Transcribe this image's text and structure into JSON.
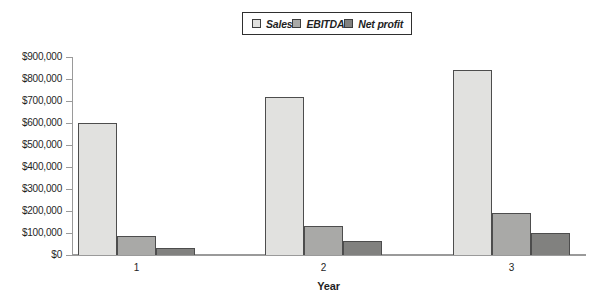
{
  "chart_data": {
    "type": "bar",
    "categories": [
      "1",
      "2",
      "3"
    ],
    "series": [
      {
        "name": "Sales",
        "color": "#e1e1df",
        "values": [
          600000,
          720000,
          840000
        ]
      },
      {
        "name": "EBITDA",
        "color": "#a9a9a7",
        "values": [
          85000,
          130000,
          190000
        ]
      },
      {
        "name": "Net profit",
        "color": "#81817f",
        "values": [
          30000,
          65000,
          100000
        ]
      }
    ],
    "title": "",
    "xlabel": "Year",
    "ylabel": "",
    "ylim": [
      0,
      900000
    ],
    "ytick_step": 100000,
    "ytick_labels": [
      "$0",
      "$100,000",
      "$200,000",
      "$300,000",
      "$400,000",
      "$500,000",
      "$600,000",
      "$700,000",
      "$800,000",
      "$900,000"
    ],
    "grid": false,
    "legend_position": "top-center",
    "colors": {
      "axis": "#9a9a9a",
      "bar_border": "#4d4d4d",
      "legend_border": "#2f2f2f",
      "text": "#1f1f1f",
      "background": "#ffffff"
    }
  }
}
